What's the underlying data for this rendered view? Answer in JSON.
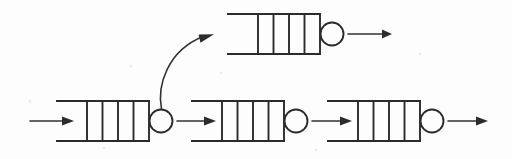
{
  "diagram": {
    "type": "queueing-network",
    "background_color": "#fdfdfd",
    "ink_color": "#2b2b2b",
    "geometry": {
      "width": 512,
      "height": 159,
      "queue_slot_count": 4,
      "queue_divider_count": 3,
      "queue_box_width": 62,
      "queue_mouth_width": 30,
      "queue_height": 40,
      "circle_radius": 11.5
    },
    "stations": [
      {
        "id": "station-top",
        "label": "top-branch-station",
        "row": "top",
        "queue_mouth_x": 228,
        "queue_box_x": 258,
        "queue_y": 14,
        "circle_cx": 332,
        "circle_cy": 34
      },
      {
        "id": "station-1",
        "label": "first-station",
        "row": "bottom",
        "queue_mouth_x": 57,
        "queue_box_x": 87,
        "queue_y": 101,
        "circle_cx": 161,
        "circle_cy": 121
      },
      {
        "id": "station-2",
        "label": "second-station",
        "row": "bottom",
        "queue_mouth_x": 192,
        "queue_box_x": 222,
        "queue_y": 101,
        "circle_cx": 296,
        "circle_cy": 121
      },
      {
        "id": "station-3",
        "label": "third-station",
        "row": "bottom",
        "queue_mouth_x": 328,
        "queue_box_x": 358,
        "queue_y": 101,
        "circle_cx": 432,
        "circle_cy": 121
      }
    ],
    "arrows": [
      {
        "id": "arrow-external-in",
        "label": "external-arrival",
        "kind": "straight",
        "x1": 30,
        "y1": 121,
        "x2": 66,
        "y2": 121
      },
      {
        "id": "arrow-branch-up",
        "label": "branch-to-top-queue",
        "kind": "curved",
        "from": "station-1-server",
        "to": "station-top-queue",
        "path": "M 161.5 109 C 158 86, 168 52, 205 36"
      },
      {
        "id": "arrow-1-to-2",
        "label": "station1-to-station2",
        "kind": "straight",
        "x1": 177,
        "y1": 121,
        "x2": 212,
        "y2": 121
      },
      {
        "id": "arrow-2-to-3",
        "label": "station2-to-station3",
        "kind": "straight",
        "x1": 312,
        "y1": 121,
        "x2": 348,
        "y2": 121
      },
      {
        "id": "arrow-3-out",
        "label": "departure-from-station3",
        "kind": "straight",
        "x1": 448,
        "y1": 121,
        "x2": 484,
        "y2": 121
      },
      {
        "id": "arrow-top-out",
        "label": "departure-from-top-station",
        "kind": "straight",
        "x1": 348,
        "y1": 34,
        "x2": 390,
        "y2": 34
      }
    ]
  }
}
